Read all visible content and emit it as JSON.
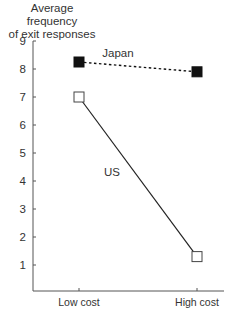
{
  "chart_data": {
    "type": "line",
    "title": "",
    "ylabel": "Average frequency of exit responses",
    "ylabel_lines": [
      "Average frequency",
      "of exit responses"
    ],
    "xlabel": "",
    "categories": [
      "Low cost",
      "High cost"
    ],
    "ylim": [
      0,
      9
    ],
    "yticks": [
      1,
      2,
      3,
      4,
      5,
      6,
      7,
      8,
      9
    ],
    "grid": false,
    "legend": "inline labels",
    "series": [
      {
        "name": "Japan",
        "values": [
          8.25,
          7.9
        ],
        "marker": "filled-square",
        "line": "dotted",
        "color": "#111111"
      },
      {
        "name": "US",
        "values": [
          7.0,
          1.3
        ],
        "marker": "open-square",
        "line": "solid",
        "color": "#222222"
      }
    ]
  }
}
